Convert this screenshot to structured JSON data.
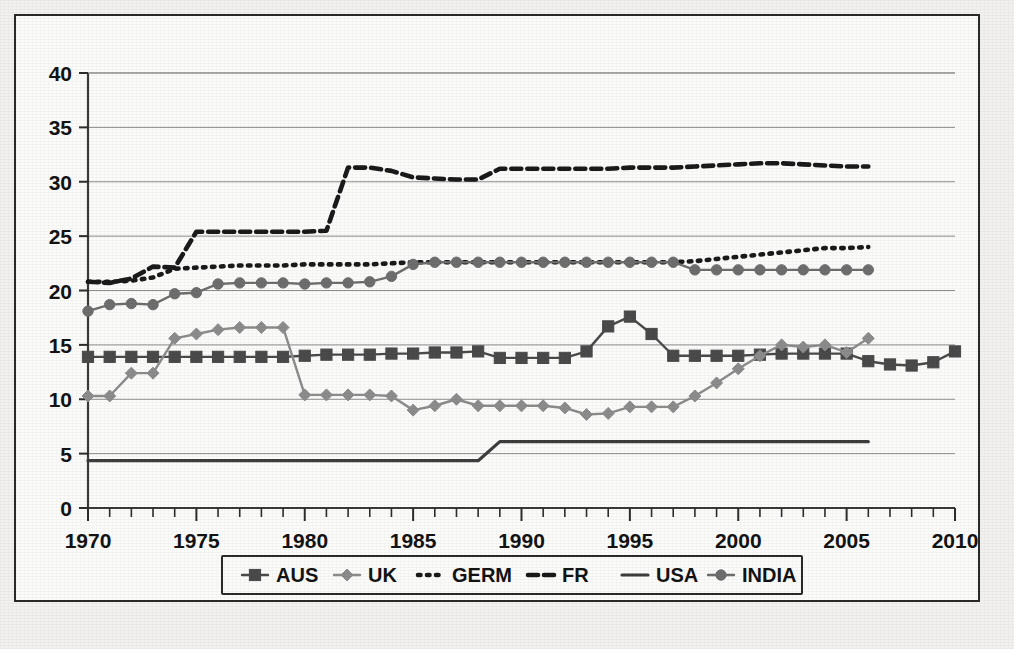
{
  "chart_data": {
    "type": "line",
    "title": "",
    "xlabel": "",
    "ylabel": "",
    "xlim": [
      1970,
      2010
    ],
    "ylim": [
      0,
      40
    ],
    "xticks": [
      1970,
      1975,
      1980,
      1985,
      1990,
      1995,
      2000,
      2005,
      2010
    ],
    "yticks": [
      0,
      5,
      10,
      15,
      20,
      25,
      30,
      35,
      40
    ],
    "ytick_labels": [
      "0",
      "5",
      "10",
      "15",
      "20",
      "25",
      "30",
      "35",
      "40"
    ],
    "xtick_labels": [
      "1970",
      "1975",
      "1980",
      "1985",
      "1990",
      "1995",
      "2000",
      "2005",
      "2010"
    ],
    "minor_xtick_interval": 1,
    "grid": "horizontal",
    "legend_position": "bottom-center",
    "series": [
      {
        "name": "AUS",
        "style": "solid-marker",
        "marker": "square",
        "color": "#4a4a4a",
        "x": [
          1970,
          1971,
          1972,
          1973,
          1974,
          1975,
          1976,
          1977,
          1978,
          1979,
          1980,
          1981,
          1982,
          1983,
          1984,
          1985,
          1986,
          1987,
          1988,
          1989,
          1990,
          1991,
          1992,
          1993,
          1994,
          1995,
          1996,
          1997,
          1998,
          1999,
          2000,
          2001,
          2002,
          2003,
          2004,
          2005,
          2006,
          2007,
          2008,
          2009,
          2010
        ],
        "values": [
          13.9,
          13.9,
          13.9,
          13.9,
          13.9,
          13.9,
          13.9,
          13.9,
          13.9,
          13.9,
          14.0,
          14.1,
          14.1,
          14.1,
          14.2,
          14.2,
          14.3,
          14.3,
          14.4,
          13.8,
          13.8,
          13.8,
          13.8,
          14.4,
          16.7,
          17.6,
          16.0,
          14.0,
          14.0,
          14.0,
          14.0,
          14.1,
          14.2,
          14.2,
          14.2,
          14.2,
          13.5,
          13.2,
          13.1,
          13.4,
          14.4
        ]
      },
      {
        "name": "UK",
        "style": "solid-marker",
        "marker": "diamond",
        "color": "#8c8c8c",
        "x": [
          1970,
          1971,
          1972,
          1973,
          1974,
          1975,
          1976,
          1977,
          1978,
          1979,
          1980,
          1981,
          1982,
          1983,
          1984,
          1985,
          1986,
          1987,
          1988,
          1989,
          1990,
          1991,
          1992,
          1993,
          1994,
          1995,
          1996,
          1997,
          1998,
          1999,
          2000,
          2001,
          2002,
          2003,
          2004,
          2005,
          2006
        ],
        "values": [
          10.3,
          10.3,
          12.4,
          12.4,
          15.6,
          16.0,
          16.4,
          16.6,
          16.6,
          16.6,
          10.4,
          10.4,
          10.4,
          10.4,
          10.3,
          9.0,
          9.4,
          10.0,
          9.4,
          9.4,
          9.4,
          9.4,
          9.2,
          8.6,
          8.7,
          9.3,
          9.3,
          9.3,
          10.3,
          11.5,
          12.8,
          14.0,
          15.0,
          14.8,
          15.0,
          14.3,
          15.6
        ]
      },
      {
        "name": "GERM",
        "style": "dotted",
        "marker": "none",
        "color": "#1a1a1a",
        "x": [
          1970,
          1971,
          1972,
          1973,
          1974,
          1975,
          1976,
          1977,
          1978,
          1979,
          1980,
          1981,
          1982,
          1983,
          1984,
          1985,
          1986,
          1987,
          1988,
          1989,
          1990,
          1991,
          1992,
          1993,
          1994,
          1995,
          1996,
          1997,
          1998,
          1999,
          2000,
          2001,
          2002,
          2003,
          2004,
          2005,
          2006
        ],
        "values": [
          20.8,
          20.8,
          20.9,
          21.2,
          22.0,
          22.1,
          22.2,
          22.3,
          22.3,
          22.3,
          22.4,
          22.4,
          22.4,
          22.4,
          22.5,
          22.6,
          22.6,
          22.6,
          22.6,
          22.6,
          22.6,
          22.6,
          22.6,
          22.6,
          22.6,
          22.6,
          22.6,
          22.6,
          22.7,
          22.9,
          23.1,
          23.3,
          23.5,
          23.7,
          23.9,
          23.9,
          24.0
        ]
      },
      {
        "name": "FR",
        "style": "dashed",
        "marker": "none",
        "color": "#1a1a1a",
        "x": [
          1970,
          1971,
          1972,
          1973,
          1974,
          1975,
          1976,
          1977,
          1978,
          1979,
          1980,
          1981,
          1982,
          1983,
          1984,
          1985,
          1986,
          1987,
          1988,
          1989,
          1990,
          1991,
          1992,
          1993,
          1994,
          1995,
          1996,
          1997,
          1998,
          1999,
          2000,
          2001,
          2002,
          2003,
          2004,
          2005,
          2006
        ],
        "values": [
          20.8,
          20.7,
          21.1,
          22.2,
          22.1,
          25.4,
          25.4,
          25.4,
          25.4,
          25.4,
          25.4,
          25.5,
          31.3,
          31.3,
          31.0,
          30.4,
          30.3,
          30.2,
          30.2,
          31.2,
          31.2,
          31.2,
          31.2,
          31.2,
          31.2,
          31.3,
          31.3,
          31.3,
          31.4,
          31.5,
          31.6,
          31.7,
          31.7,
          31.6,
          31.5,
          31.4,
          31.4
        ]
      },
      {
        "name": "USA",
        "style": "solid",
        "marker": "none",
        "color": "#3d3d3d",
        "x": [
          1970,
          1988,
          1989,
          2006
        ],
        "values": [
          4.35,
          4.35,
          6.1,
          6.1
        ]
      },
      {
        "name": "INDIA",
        "style": "solid-marker",
        "marker": "circle",
        "color": "#6e6e6e",
        "x": [
          1970,
          1971,
          1972,
          1973,
          1974,
          1975,
          1976,
          1977,
          1978,
          1979,
          1980,
          1981,
          1982,
          1983,
          1984,
          1985,
          1986,
          1987,
          1988,
          1989,
          1990,
          1991,
          1992,
          1993,
          1994,
          1995,
          1996,
          1997,
          1998,
          1999,
          2000,
          2001,
          2002,
          2003,
          2004,
          2005,
          2006
        ],
        "values": [
          18.1,
          18.7,
          18.8,
          18.7,
          19.7,
          19.8,
          20.6,
          20.7,
          20.7,
          20.7,
          20.6,
          20.7,
          20.7,
          20.8,
          21.3,
          22.4,
          22.6,
          22.6,
          22.6,
          22.6,
          22.6,
          22.6,
          22.6,
          22.6,
          22.6,
          22.6,
          22.6,
          22.6,
          21.9,
          21.9,
          21.9,
          21.9,
          21.9,
          21.9,
          21.9,
          21.9,
          21.9
        ]
      }
    ],
    "legend": [
      {
        "label": "AUS",
        "style": "solid-marker",
        "marker": "square",
        "color": "#4a4a4a"
      },
      {
        "label": "UK",
        "style": "solid-marker",
        "marker": "diamond",
        "color": "#8c8c8c"
      },
      {
        "label": "GERM",
        "style": "dotted",
        "marker": "none",
        "color": "#1a1a1a"
      },
      {
        "label": "FR",
        "style": "dashed",
        "marker": "none",
        "color": "#1a1a1a"
      },
      {
        "label": "USA",
        "style": "solid",
        "marker": "none",
        "color": "#3d3d3d"
      },
      {
        "label": "INDIA",
        "style": "solid-marker",
        "marker": "circle",
        "color": "#6e6e6e"
      }
    ]
  }
}
